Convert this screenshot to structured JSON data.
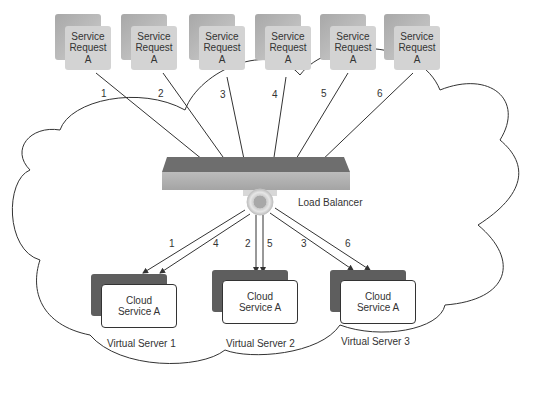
{
  "diagram": {
    "type": "load-balancing",
    "service_requests": [
      {
        "id": 1,
        "line1": "Service",
        "line2": "Request",
        "line3": "A",
        "arrow_label": "1"
      },
      {
        "id": 2,
        "line1": "Service",
        "line2": "Request",
        "line3": "A",
        "arrow_label": "2"
      },
      {
        "id": 3,
        "line1": "Service",
        "line2": "Request",
        "line3": "A",
        "arrow_label": "3"
      },
      {
        "id": 4,
        "line1": "Service",
        "line2": "Request",
        "line3": "A",
        "arrow_label": "4"
      },
      {
        "id": 5,
        "line1": "Service",
        "line2": "Request",
        "line3": "A",
        "arrow_label": "5"
      },
      {
        "id": 6,
        "line1": "Service",
        "line2": "Request",
        "line3": "A",
        "arrow_label": "6"
      }
    ],
    "load_balancer": {
      "label": "Load Balancer"
    },
    "virtual_servers": [
      {
        "name": "Virtual Server 1",
        "service_line1": "Cloud",
        "service_line2": "Service A",
        "arrow_labels": [
          "1",
          "4"
        ]
      },
      {
        "name": "Virtual Server 2",
        "service_line1": "Cloud",
        "service_line2": "Service A",
        "arrow_labels": [
          "2",
          "5"
        ]
      },
      {
        "name": "Virtual Server 3",
        "service_line1": "Cloud",
        "service_line2": "Service A",
        "arrow_labels": [
          "3",
          "6"
        ]
      }
    ],
    "colors": {
      "request_box": "#d3d3d3",
      "balancer_top": "#6e6e6e",
      "balancer_front": "#b0b0b0",
      "server_back": "#5e5e5e",
      "line": "#333333"
    }
  }
}
